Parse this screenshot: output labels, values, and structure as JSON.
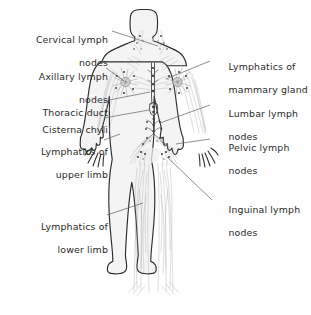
{
  "figure": {
    "background_color": "#fefefe",
    "ink_color": "#2e2e2e",
    "label_color": "#2b2b2b",
    "leader_color": "#6b6b6b"
  },
  "labels": {
    "left": [
      {
        "id": "cervical",
        "line1": "Cervical lymph",
        "line2": "nodes"
      },
      {
        "id": "axillary",
        "line1": "Axillary lymph",
        "line2": "nodes"
      },
      {
        "id": "thoracic_duct",
        "line1": "Thoracic duct",
        "line2": ""
      },
      {
        "id": "cisterna_chyli",
        "line1": "Cisterna chyli",
        "line2": ""
      },
      {
        "id": "upper_limb",
        "line1": "Lymphatics of",
        "line2": "upper limb"
      },
      {
        "id": "lower_limb",
        "line1": "Lymphatics of",
        "line2": "lower limb"
      }
    ],
    "right": [
      {
        "id": "mammary",
        "line1": "Lymphatics of",
        "line2": "mammary gland"
      },
      {
        "id": "lumbar",
        "line1": "Lumbar lymph",
        "line2": "nodes"
      },
      {
        "id": "pelvic",
        "line1": "Pelvic lymph",
        "line2": "nodes"
      },
      {
        "id": "inguinal",
        "line1": "Inguinal lymph",
        "line2": "nodes"
      }
    ]
  }
}
